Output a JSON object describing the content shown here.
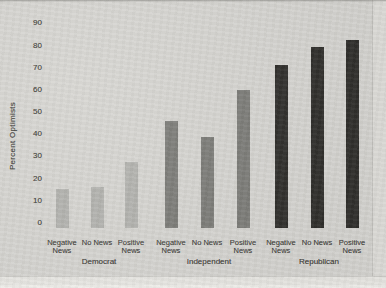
{
  "page": {
    "background_color": "#d7d6d2",
    "bottom_strip_color": "#e9e8e4",
    "right_strip_color": "#e0dfdb",
    "text_color": "#4a4944"
  },
  "chart_data": {
    "type": "bar",
    "title": "",
    "xlabel": "",
    "ylabel": "Percent Optimists",
    "ylim": [
      0,
      90
    ],
    "yticks": [
      0,
      10,
      20,
      30,
      40,
      50,
      60,
      70,
      80,
      90
    ],
    "grid": false,
    "legend": "none",
    "categories": [
      "Negative News",
      "No News",
      "Positive News"
    ],
    "groups": [
      {
        "label": "Democrat",
        "color": "#b3b3af",
        "bars": [
          {
            "label": "Negative News",
            "value": 17
          },
          {
            "label": "No News",
            "value": 18
          },
          {
            "label": "Positive News",
            "value": 29
          }
        ]
      },
      {
        "label": "Independent",
        "color": "#7c7c78",
        "bars": [
          {
            "label": "Negative News",
            "value": 47
          },
          {
            "label": "No News",
            "value": 40
          },
          {
            "label": "Positive News",
            "value": 61
          }
        ]
      },
      {
        "label": "Republican",
        "color": "#2e2d2a",
        "bars": [
          {
            "label": "Negative News",
            "value": 72
          },
          {
            "label": "No News",
            "value": 80
          },
          {
            "label": "Positive News",
            "value": 83
          }
        ]
      }
    ]
  }
}
